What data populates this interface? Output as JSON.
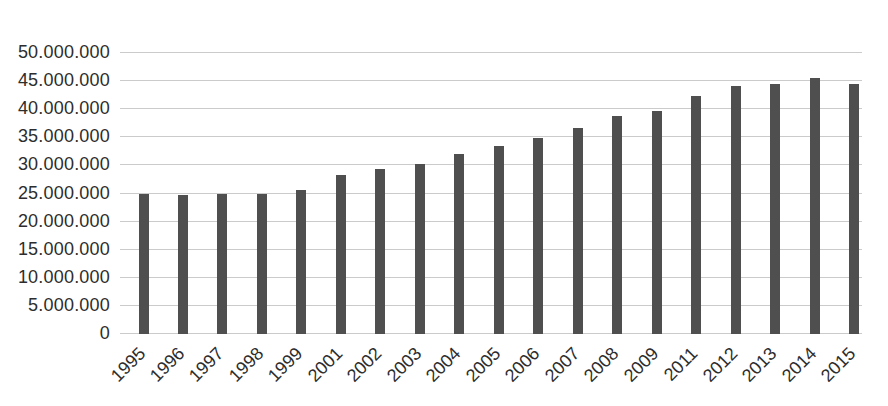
{
  "chart_data": {
    "type": "bar",
    "title": "",
    "categories": [
      "1995",
      "1996",
      "1997",
      "1998",
      "1999",
      "2001",
      "2002",
      "2003",
      "2004",
      "2005",
      "2006",
      "2007",
      "2008",
      "2009",
      "2011",
      "2012",
      "2013",
      "2014",
      "2015"
    ],
    "values": [
      24800000,
      24700000,
      24900000,
      24800000,
      25500000,
      28200000,
      29200000,
      30200000,
      32000000,
      33400000,
      34700000,
      36500000,
      38600000,
      39500000,
      42200000,
      43900000,
      44300000,
      45400000,
      44400000
    ],
    "y_tick_labels": [
      "50.000.000",
      "45.000.000",
      "40.000.000",
      "35.000.000",
      "30.000.000",
      "25.000.000",
      "20.000.000",
      "15.000.000",
      "10.000.000",
      "5.000.000",
      "0"
    ],
    "ylim": [
      0,
      50000000
    ],
    "grid": true,
    "legend": false,
    "colors": {
      "bar": "#4f4f4f",
      "gridline": "#cbcbcb",
      "text": "#2d2d2d",
      "background": "#ffffff"
    }
  }
}
